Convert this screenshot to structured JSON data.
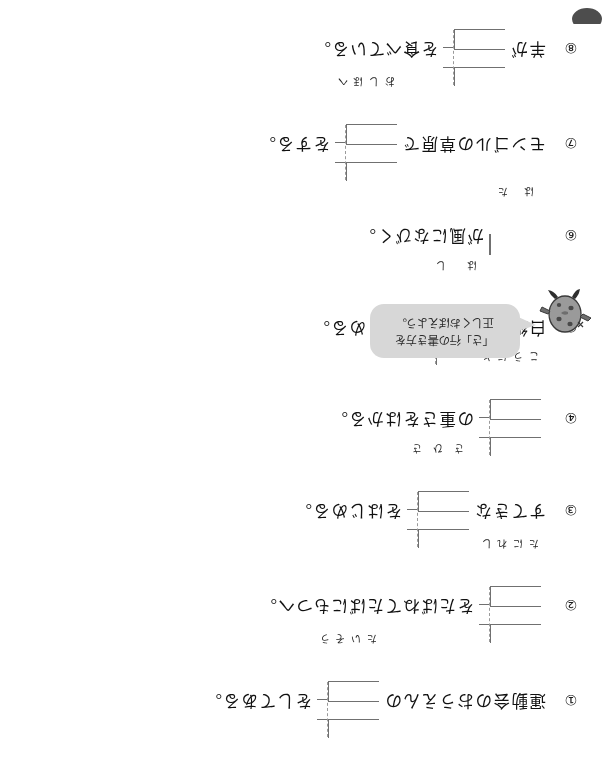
{
  "worksheet": {
    "orientation_degrees": 180,
    "mascot": {
      "name": "bean-character-mascot",
      "balloon_line1": "「さ」行の書き方を",
      "balloon_line2": "正しくおぼえよう。"
    },
    "items": [
      {
        "number": "①",
        "before": "運動会のおうえんの",
        "box": {
          "cells": 2,
          "hints": [
            "た",
            "い",
            "そ",
            "う"
          ]
        },
        "after": "をしてある。"
      },
      {
        "number": "②",
        "before": "",
        "box": {
          "cells": 2,
          "hints": [
            "た",
            "に",
            "れ",
            "し"
          ]
        },
        "after": "をたばねてたばにもつへ。"
      },
      {
        "number": "③",
        "before": "すてきな",
        "box": {
          "cells": 2,
          "hints": [
            "さ",
            "ひ",
            "さ"
          ]
        },
        "after": "をはじめる。"
      },
      {
        "number": "④",
        "before": "",
        "box": {
          "cells": 2,
          "hints": [
            "こ",
            "う",
            "に",
            "と"
          ]
        },
        "after": "の重さをはかる。"
      },
      {
        "number": "⑤",
        "before": "白紙の",
        "box": {
          "cells": 2,
          "hints": [
            "は",
            "し"
          ]
        },
        "after": "をまとめる。"
      },
      {
        "number": "⑥",
        "before": "",
        "box": {
          "cells": 1,
          "hints": [
            "は",
            "た"
          ]
        },
        "after": "が風になびく。"
      },
      {
        "number": "⑦",
        "before": "モンゴルの草原で",
        "box": {
          "cells": 2,
          "hints": [
            "お",
            "し",
            "ほ",
            "へ"
          ]
        },
        "after": "をする。"
      },
      {
        "number": "⑧",
        "before": "羊が",
        "box": {
          "cells": 2,
          "hints": [
            "ほ",
            "へ",
            "き",
            "し"
          ]
        },
        "after": "を食べている。"
      }
    ]
  }
}
